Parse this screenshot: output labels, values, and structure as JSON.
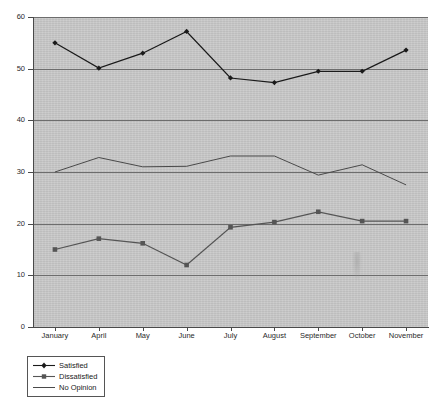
{
  "chart_data": {
    "type": "line",
    "title": "",
    "subtitle": "",
    "xlabel": "",
    "ylabel": "",
    "categories": [
      "January",
      "April",
      "May",
      "June",
      "July",
      "August",
      "September",
      "October",
      "November"
    ],
    "ylim": [
      0,
      60
    ],
    "yticks": [
      0,
      10,
      20,
      30,
      40,
      50,
      60
    ],
    "grid": true,
    "legend_position": "bottom-left",
    "plot_background": "#c9c9c9",
    "series": [
      {
        "name": "Satisfied",
        "marker": "diamond",
        "color": "#1a1a1a",
        "values": [
          55.0,
          50.1,
          53.0,
          57.2,
          48.2,
          47.3,
          49.5,
          49.5,
          53.6
        ]
      },
      {
        "name": "Dissatisfied",
        "marker": "square",
        "color": "#555555",
        "values": [
          15.0,
          17.1,
          16.2,
          12.0,
          19.3,
          20.3,
          22.3,
          20.5,
          20.5
        ]
      },
      {
        "name": "No Opinion",
        "marker": "none",
        "color": "#4a4a4a",
        "values": [
          30.0,
          32.8,
          31.0,
          31.1,
          33.1,
          33.1,
          29.4,
          31.4,
          27.5
        ]
      }
    ]
  },
  "legend": {
    "items": [
      {
        "label": "Satisfied"
      },
      {
        "label": "Dissatisfied"
      },
      {
        "label": "No Opinion"
      }
    ]
  },
  "yticks_text": [
    "60",
    "50",
    "40",
    "30",
    "20",
    "10",
    "0"
  ]
}
